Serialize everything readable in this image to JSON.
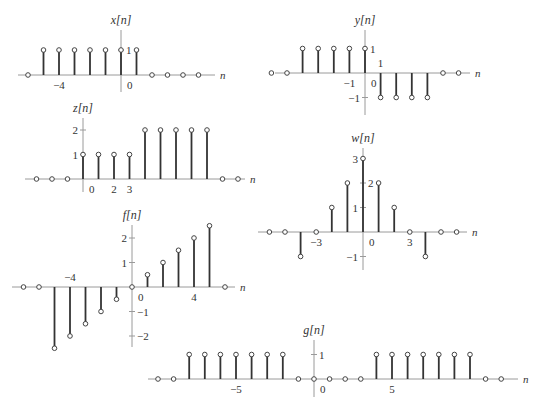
{
  "chart_data": [
    {
      "name": "x",
      "type": "stem",
      "title": "x[n]",
      "xlabel": "n",
      "n": [
        -6,
        -5,
        -4,
        -3,
        -2,
        -1,
        0,
        1,
        2,
        3,
        4,
        5
      ],
      "values": [
        0,
        1,
        1,
        1,
        1,
        1,
        1,
        1,
        0,
        0,
        0,
        0
      ],
      "x_tick_labels": [
        {
          "n": -4,
          "text": "−4"
        },
        {
          "n": 0,
          "text": "0",
          "offset": 6
        }
      ],
      "y_tick_labels": [
        {
          "v": 1,
          "text": "1",
          "side": "right"
        }
      ],
      "layout": {
        "ox": 121,
        "oy": 75,
        "dx": 15.5,
        "dy": 25,
        "xl": 18,
        "xr": 215,
        "yt": 30,
        "yb": 92,
        "title_y": 24
      }
    },
    {
      "name": "y",
      "type": "stem",
      "title": "y[n]",
      "xlabel": "n",
      "n": [
        -6,
        -5,
        -4,
        -3,
        -2,
        -1,
        0,
        1,
        2,
        3,
        4,
        5,
        6
      ],
      "values": [
        0,
        0,
        1,
        1,
        1,
        1,
        1,
        -1,
        -1,
        -1,
        -1,
        0,
        0
      ],
      "x_tick_labels": [
        {
          "n": -1,
          "text": "−1",
          "below": true
        },
        {
          "n": 0,
          "text": "0",
          "offset": 6
        },
        {
          "n": 1,
          "text": "1",
          "above": true
        }
      ],
      "y_tick_labels": [
        {
          "v": 1,
          "text": "1",
          "side": "right"
        },
        {
          "v": -1,
          "text": "−1",
          "side": "left"
        }
      ],
      "layout": {
        "ox": 365,
        "oy": 73,
        "dx": 15.6,
        "dy": 24.5,
        "xl": 275,
        "xr": 470,
        "yt": 30,
        "yb": 115,
        "title_y": 24
      }
    },
    {
      "name": "z",
      "type": "stem",
      "title": "z[n]",
      "xlabel": "n",
      "n": [
        -3,
        -2,
        -1,
        0,
        1,
        2,
        3,
        4,
        5,
        6,
        7,
        8,
        9,
        10
      ],
      "values": [
        0,
        0,
        0,
        1,
        1,
        1,
        1,
        2,
        2,
        2,
        2,
        2,
        0,
        0
      ],
      "x_tick_labels": [
        {
          "n": 0,
          "text": "0",
          "offset": 6
        },
        {
          "n": 2,
          "text": "2"
        },
        {
          "n": 3,
          "text": "3"
        }
      ],
      "y_tick_labels": [
        {
          "v": 1,
          "text": "1",
          "side": "left"
        },
        {
          "v": 2,
          "text": "2",
          "side": "left"
        }
      ],
      "layout": {
        "ox": 83,
        "oy": 179,
        "dx": 15.5,
        "dy": 24.5,
        "xl": 25,
        "xr": 245,
        "yt": 118,
        "yb": 192,
        "title_y": 112
      }
    },
    {
      "name": "w",
      "type": "stem",
      "title": "w[n]",
      "xlabel": "n",
      "n": [
        -6,
        -5,
        -4,
        -3,
        -2,
        -1,
        0,
        1,
        2,
        3,
        4,
        5,
        6
      ],
      "values": [
        0,
        0,
        -1,
        0,
        1,
        2,
        3,
        2,
        1,
        0,
        -1,
        0,
        0
      ],
      "x_tick_labels": [
        {
          "n": -3,
          "text": "−3"
        },
        {
          "n": 0,
          "text": "0",
          "offset": 6
        },
        {
          "n": 3,
          "text": "3"
        }
      ],
      "y_tick_labels": [
        {
          "v": 1,
          "text": "1",
          "side": "left"
        },
        {
          "v": 2,
          "text": "2",
          "side": "right"
        },
        {
          "v": 3,
          "text": "3",
          "side": "left"
        },
        {
          "v": -1,
          "text": "−1",
          "side": "left"
        }
      ],
      "layout": {
        "ox": 363,
        "oy": 232,
        "dx": 15.6,
        "dy": 24.5,
        "xl": 258,
        "xr": 467,
        "yt": 148,
        "yb": 270,
        "title_y": 142
      }
    },
    {
      "name": "f",
      "type": "stem",
      "title": "f[n]",
      "xlabel": "n",
      "n": [
        -7,
        -6,
        -5,
        -4,
        -3,
        -2,
        -1,
        0,
        1,
        2,
        3,
        4,
        5,
        6
      ],
      "values": [
        0,
        0,
        -2.5,
        -2,
        -1.5,
        -1,
        -0.5,
        0,
        0.5,
        1,
        1.5,
        2,
        2.5,
        0
      ],
      "x_tick_labels": [
        {
          "n": -4,
          "text": "−4",
          "above": true
        },
        {
          "n": 0,
          "text": "0",
          "offset": 6
        },
        {
          "n": 4,
          "text": "4"
        }
      ],
      "y_tick_labels": [
        {
          "v": 1,
          "text": "1",
          "side": "left"
        },
        {
          "v": 2,
          "text": "2",
          "side": "left"
        },
        {
          "v": -1,
          "text": "−1",
          "side": "right"
        },
        {
          "v": -2,
          "text": "−2",
          "side": "right"
        }
      ],
      "layout": {
        "ox": 132,
        "oy": 287,
        "dx": 15.5,
        "dy": 24.5,
        "xl": 12,
        "xr": 235,
        "yt": 225,
        "yb": 347,
        "title_y": 219
      }
    },
    {
      "name": "g",
      "type": "stem",
      "title": "g[n]",
      "xlabel": "n",
      "n": [
        -10,
        -9,
        -8,
        -7,
        -6,
        -5,
        -4,
        -3,
        -2,
        -1,
        0,
        1,
        2,
        3,
        4,
        5,
        6,
        7,
        8,
        9,
        10,
        11,
        12
      ],
      "values": [
        0,
        0,
        1,
        1,
        1,
        1,
        1,
        1,
        1,
        0,
        0,
        0,
        0,
        0,
        1,
        1,
        1,
        1,
        1,
        1,
        1,
        0,
        0
      ],
      "x_tick_labels": [
        {
          "n": -5,
          "text": "−5"
        },
        {
          "n": 0,
          "text": "0",
          "offset": 6
        },
        {
          "n": 5,
          "text": "5"
        }
      ],
      "y_tick_labels": [
        {
          "v": 1,
          "text": "1",
          "side": "right"
        }
      ],
      "layout": {
        "ox": 314,
        "oy": 379,
        "dx": 15.6,
        "dy": 24.5,
        "xl": 148,
        "xr": 518,
        "yt": 340,
        "yb": 397,
        "title_y": 334
      }
    }
  ]
}
